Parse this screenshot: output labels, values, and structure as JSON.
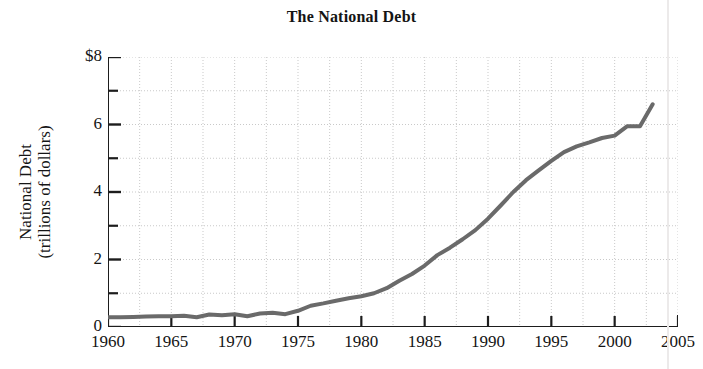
{
  "chart_data": {
    "type": "line",
    "title": "The National Debt",
    "xlabel": "",
    "ylabel": "National Debt (trillions of dollars)",
    "ylabel_line1": "National Debt",
    "ylabel_line2": "(trillions of dollars)",
    "xlim": [
      1960,
      2005
    ],
    "ylim": [
      0,
      8
    ],
    "y_tick_labels": [
      "$8",
      "6",
      "4",
      "2",
      "0"
    ],
    "y_tick_values": [
      8,
      6,
      4,
      2,
      0
    ],
    "y_minor_tick_values": [
      7,
      5,
      3,
      1
    ],
    "x_tick_labels": [
      "1960",
      "1965",
      "1970",
      "1975",
      "1980",
      "1985",
      "1990",
      "1995",
      "2000",
      "2005"
    ],
    "x_tick_values": [
      1960,
      1965,
      1970,
      1975,
      1980,
      1985,
      1990,
      1995,
      2000,
      2005
    ],
    "grid": true,
    "grid_style": "dotted",
    "grid_x_step": 2.5,
    "grid_y_step": 1,
    "legend": "none",
    "line_color": "#6a6a6a",
    "line_width": 4,
    "units": "trillions of dollars",
    "x": [
      1960,
      1961,
      1962,
      1963,
      1964,
      1965,
      1966,
      1967,
      1968,
      1969,
      1970,
      1971,
      1972,
      1973,
      1974,
      1975,
      1976,
      1977,
      1978,
      1979,
      1980,
      1981,
      1982,
      1983,
      1984,
      1985,
      1986,
      1987,
      1988,
      1989,
      1990,
      1991,
      1992,
      1993,
      1994,
      1995,
      1996,
      1997,
      1998,
      1999,
      2000,
      2001,
      2002,
      2003
    ],
    "values": [
      0.29,
      0.29,
      0.3,
      0.31,
      0.32,
      0.32,
      0.33,
      0.29,
      0.37,
      0.35,
      0.38,
      0.32,
      0.4,
      0.42,
      0.38,
      0.48,
      0.63,
      0.7,
      0.78,
      0.85,
      0.91,
      1.0,
      1.15,
      1.37,
      1.57,
      1.82,
      2.13,
      2.35,
      2.6,
      2.87,
      3.21,
      3.6,
      4.0,
      4.35,
      4.64,
      4.92,
      5.18,
      5.35,
      5.47,
      5.6,
      5.67,
      5.95,
      5.95,
      6.6
    ],
    "series_name": "National Debt",
    "annotations": []
  }
}
